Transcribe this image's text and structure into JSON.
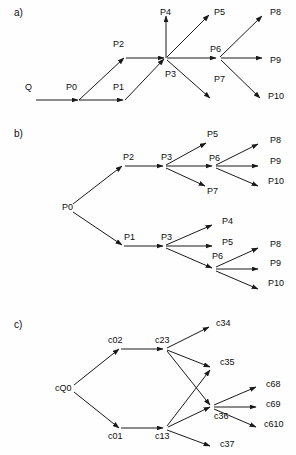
{
  "figure": {
    "width": 296,
    "height": 455,
    "background": "#fefefe",
    "stroke_color": "#1a1a1a",
    "text_color": "#0d0d0d"
  },
  "panels": [
    {
      "id": "panel-a",
      "label": "a)",
      "label_x": 14,
      "label_y": 13,
      "nodes": [
        {
          "id": "a-Q",
          "text": "Q",
          "x": 25,
          "y": 88
        },
        {
          "id": "a-P0",
          "text": "P0",
          "x": 66,
          "y": 88
        },
        {
          "id": "a-P1",
          "text": "P1",
          "x": 113,
          "y": 88
        },
        {
          "id": "a-P2",
          "text": "P2",
          "x": 113,
          "y": 45
        },
        {
          "id": "a-P3",
          "text": "P3",
          "x": 165,
          "y": 75
        },
        {
          "id": "a-P4",
          "text": "P4",
          "x": 160,
          "y": 13
        },
        {
          "id": "a-P5",
          "text": "P5",
          "x": 214,
          "y": 13
        },
        {
          "id": "a-P6",
          "text": "P6",
          "x": 210,
          "y": 50
        },
        {
          "id": "a-P7",
          "text": "P7",
          "x": 214,
          "y": 80
        },
        {
          "id": "a-P8",
          "text": "P8",
          "x": 270,
          "y": 13
        },
        {
          "id": "a-P9",
          "text": "P9",
          "x": 270,
          "y": 61
        },
        {
          "id": "a-P10",
          "text": "P10",
          "x": 268,
          "y": 97
        }
      ],
      "edges": [
        {
          "from": "Q",
          "to": "P0",
          "x1": 36,
          "y1": 100,
          "x2": 78,
          "y2": 100
        },
        {
          "from": "P0",
          "to": "P1",
          "x1": 79,
          "y1": 100,
          "x2": 123,
          "y2": 100
        },
        {
          "from": "P0",
          "to": "P2",
          "x1": 79,
          "y1": 100,
          "x2": 124,
          "y2": 58
        },
        {
          "from": "P2",
          "to": "P3",
          "x1": 126,
          "y1": 58,
          "x2": 164,
          "y2": 58
        },
        {
          "from": "P1",
          "to": "P3",
          "x1": 125,
          "y1": 100,
          "x2": 164,
          "y2": 59
        },
        {
          "from": "P3",
          "to": "P4",
          "x1": 166,
          "y1": 58,
          "x2": 166,
          "y2": 16
        },
        {
          "from": "P3",
          "to": "P5",
          "x1": 167,
          "y1": 57,
          "x2": 209,
          "y2": 15
        },
        {
          "from": "P3",
          "to": "P6",
          "x1": 167,
          "y1": 58,
          "x2": 216,
          "y2": 58
        },
        {
          "from": "P3",
          "to": "P7",
          "x1": 167,
          "y1": 60,
          "x2": 210,
          "y2": 98
        },
        {
          "from": "P6",
          "to": "P8",
          "x1": 220,
          "y1": 57,
          "x2": 262,
          "y2": 16
        },
        {
          "from": "P6",
          "to": "P9",
          "x1": 221,
          "y1": 58,
          "x2": 262,
          "y2": 58
        },
        {
          "from": "P6",
          "to": "P10",
          "x1": 221,
          "y1": 60,
          "x2": 260,
          "y2": 98
        }
      ]
    },
    {
      "id": "panel-b",
      "label": "b)",
      "label_x": 14,
      "label_y": 134,
      "nodes": [
        {
          "id": "b-P0",
          "text": "P0",
          "x": 62,
          "y": 208
        },
        {
          "id": "b-P2",
          "text": "P2",
          "x": 123,
          "y": 158
        },
        {
          "id": "b-P3u",
          "text": "P3",
          "x": 161,
          "y": 158
        },
        {
          "id": "b-P5u",
          "text": "P5",
          "x": 207,
          "y": 135
        },
        {
          "id": "b-P6u",
          "text": "P6",
          "x": 209,
          "y": 159
        },
        {
          "id": "b-P7u",
          "text": "P7",
          "x": 207,
          "y": 192
        },
        {
          "id": "b-P8u",
          "text": "P8",
          "x": 270,
          "y": 141
        },
        {
          "id": "b-P9u",
          "text": "P9",
          "x": 270,
          "y": 162
        },
        {
          "id": "b-P10u",
          "text": "P10",
          "x": 268,
          "y": 182
        },
        {
          "id": "b-P1",
          "text": "P1",
          "x": 124,
          "y": 238
        },
        {
          "id": "b-P3l",
          "text": "P3",
          "x": 161,
          "y": 238
        },
        {
          "id": "b-P4l",
          "text": "P4",
          "x": 222,
          "y": 222
        },
        {
          "id": "b-P5l",
          "text": "P5",
          "x": 222,
          "y": 243
        },
        {
          "id": "b-P6l",
          "text": "P6",
          "x": 212,
          "y": 257
        },
        {
          "id": "b-P8l",
          "text": "P8",
          "x": 270,
          "y": 245
        },
        {
          "id": "b-P9l",
          "text": "P9",
          "x": 270,
          "y": 264
        },
        {
          "id": "b-P10l",
          "text": "P10",
          "x": 268,
          "y": 284
        }
      ],
      "edges": [
        {
          "from": "P0",
          "to": "P2",
          "x1": 73,
          "y1": 204,
          "x2": 122,
          "y2": 166
        },
        {
          "from": "P0",
          "to": "P1",
          "x1": 73,
          "y1": 212,
          "x2": 122,
          "y2": 245
        },
        {
          "from": "P2",
          "to": "P3",
          "x1": 125,
          "y1": 166,
          "x2": 163,
          "y2": 166
        },
        {
          "from": "P3",
          "to": "P5",
          "x1": 166,
          "y1": 165,
          "x2": 206,
          "y2": 143
        },
        {
          "from": "P3",
          "to": "P6",
          "x1": 166,
          "y1": 166,
          "x2": 212,
          "y2": 166
        },
        {
          "from": "P3",
          "to": "P7",
          "x1": 166,
          "y1": 168,
          "x2": 205,
          "y2": 186
        },
        {
          "from": "P6",
          "to": "P8",
          "x1": 216,
          "y1": 165,
          "x2": 258,
          "y2": 144
        },
        {
          "from": "P6",
          "to": "P9",
          "x1": 216,
          "y1": 166,
          "x2": 258,
          "y2": 166
        },
        {
          "from": "P6",
          "to": "P10",
          "x1": 216,
          "y1": 168,
          "x2": 258,
          "y2": 186
        },
        {
          "from": "P1",
          "to": "P3",
          "x1": 124,
          "y1": 246,
          "x2": 163,
          "y2": 246
        },
        {
          "from": "P3",
          "to": "P4",
          "x1": 166,
          "y1": 245,
          "x2": 212,
          "y2": 225
        },
        {
          "from": "P3",
          "to": "P5",
          "x1": 166,
          "y1": 246,
          "x2": 212,
          "y2": 246
        },
        {
          "from": "P3",
          "to": "P6",
          "x1": 166,
          "y1": 248,
          "x2": 212,
          "y2": 268
        },
        {
          "from": "P6",
          "to": "P8",
          "x1": 216,
          "y1": 267,
          "x2": 258,
          "y2": 248
        },
        {
          "from": "P6",
          "to": "P9",
          "x1": 216,
          "y1": 269,
          "x2": 258,
          "y2": 269
        },
        {
          "from": "P6",
          "to": "P10",
          "x1": 216,
          "y1": 271,
          "x2": 258,
          "y2": 289
        }
      ]
    },
    {
      "id": "panel-c",
      "label": "c)",
      "label_x": 14,
      "label_y": 325,
      "nodes": [
        {
          "id": "c-cQ0",
          "text": "cQ0",
          "x": 55,
          "y": 389
        },
        {
          "id": "c-c02",
          "text": "c02",
          "x": 108,
          "y": 341
        },
        {
          "id": "c-c23",
          "text": "c23",
          "x": 155,
          "y": 341
        },
        {
          "id": "c-c34",
          "text": "c34",
          "x": 216,
          "y": 324
        },
        {
          "id": "c-c35",
          "text": "c35",
          "x": 220,
          "y": 363
        },
        {
          "id": "c-c36",
          "text": "c36",
          "x": 214,
          "y": 417
        },
        {
          "id": "c-c37",
          "text": "c37",
          "x": 220,
          "y": 445
        },
        {
          "id": "c-c68",
          "text": "c68",
          "x": 266,
          "y": 385
        },
        {
          "id": "c-c69",
          "text": "c69",
          "x": 266,
          "y": 405
        },
        {
          "id": "c-c610",
          "text": "c610",
          "x": 264,
          "y": 425
        },
        {
          "id": "c-c01",
          "text": "c01",
          "x": 108,
          "y": 437
        },
        {
          "id": "c-c13",
          "text": "c13",
          "x": 155,
          "y": 437
        }
      ],
      "edges": [
        {
          "from": "cQ0",
          "to": "c02",
          "x1": 74,
          "y1": 385,
          "x2": 119,
          "y2": 349
        },
        {
          "from": "cQ0",
          "to": "c01",
          "x1": 74,
          "y1": 392,
          "x2": 119,
          "y2": 428
        },
        {
          "from": "c02",
          "to": "c23",
          "x1": 121,
          "y1": 349,
          "x2": 163,
          "y2": 349
        },
        {
          "from": "c23",
          "to": "c34",
          "x1": 167,
          "y1": 348,
          "x2": 209,
          "y2": 327
        },
        {
          "from": "c23",
          "to": "c35",
          "x1": 167,
          "y1": 350,
          "x2": 210,
          "y2": 367
        },
        {
          "from": "c23",
          "to": "c36",
          "x1": 167,
          "y1": 351,
          "x2": 210,
          "y2": 405
        },
        {
          "from": "c01",
          "to": "c13",
          "x1": 121,
          "y1": 428,
          "x2": 163,
          "y2": 428
        },
        {
          "from": "c13",
          "to": "c35",
          "x1": 167,
          "y1": 426,
          "x2": 210,
          "y2": 370
        },
        {
          "from": "c13",
          "to": "c36",
          "x1": 168,
          "y1": 427,
          "x2": 210,
          "y2": 407
        },
        {
          "from": "c13",
          "to": "c37",
          "x1": 167,
          "y1": 430,
          "x2": 210,
          "y2": 446
        },
        {
          "from": "c36",
          "to": "c68",
          "x1": 214,
          "y1": 405,
          "x2": 256,
          "y2": 387
        },
        {
          "from": "c36",
          "to": "c69",
          "x1": 214,
          "y1": 407,
          "x2": 256,
          "y2": 407
        },
        {
          "from": "c36",
          "to": "c610",
          "x1": 214,
          "y1": 409,
          "x2": 256,
          "y2": 427
        }
      ]
    }
  ]
}
